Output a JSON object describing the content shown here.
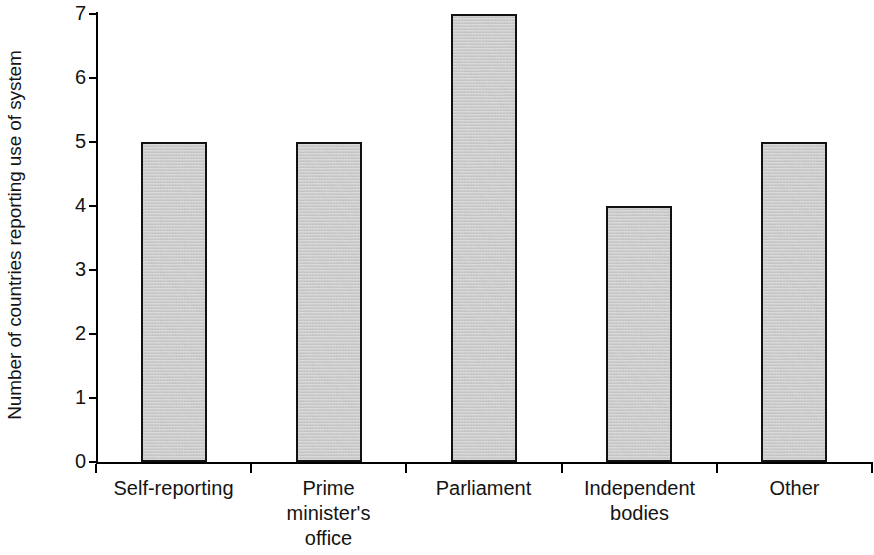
{
  "chart_data": {
    "type": "bar",
    "title": "",
    "subtitle": "",
    "xlabel": "",
    "ylabel": "Number of countries reporting use of system",
    "categories": [
      "Self-reporting",
      "Prime minister's office",
      "Parliament",
      "Independent bodies",
      "Other"
    ],
    "category_lines": [
      [
        "Self-reporting"
      ],
      [
        "Prime",
        "minister's",
        "office"
      ],
      [
        "Parliament"
      ],
      [
        "Independent",
        "bodies"
      ],
      [
        "Other"
      ]
    ],
    "values": [
      5,
      5,
      7,
      4,
      5
    ],
    "ylim": [
      0,
      7
    ],
    "ytick_labels": [
      "0",
      "1",
      "2",
      "3",
      "4",
      "5",
      "6",
      "7"
    ],
    "ytick_values": [
      0,
      1,
      2,
      3,
      4,
      5,
      6,
      7
    ],
    "grid": false,
    "legend": false,
    "legend_position": "none",
    "bar_fill_color": "#c9c9c9",
    "bar_border_color": "#111111",
    "axis_color": "#000000",
    "text_color": "#141414",
    "background_color": "#ffffff"
  }
}
